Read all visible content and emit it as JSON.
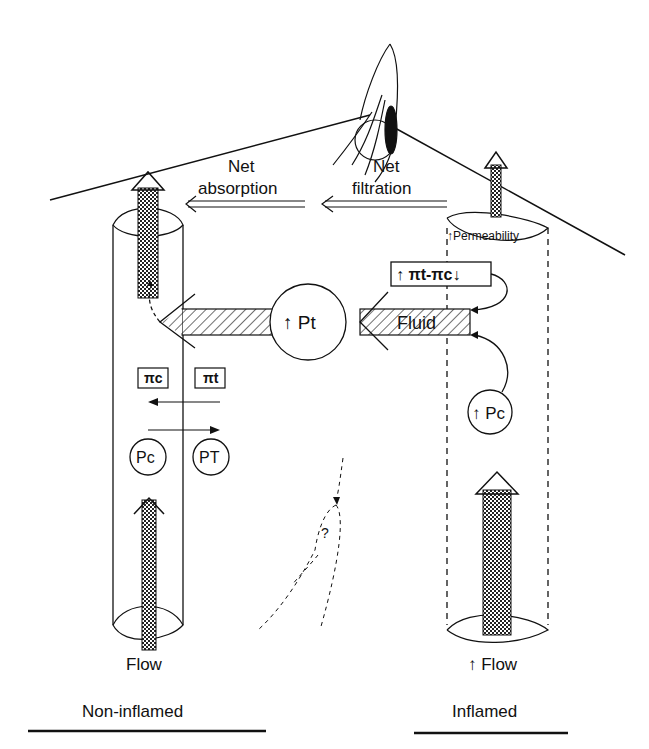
{
  "labels": {
    "net_absorption_1": "Net",
    "net_absorption_2": "absorption",
    "net_filtration_1": "Net",
    "net_filtration_2": "filtration",
    "permeability": "↑Permeability",
    "oncotic_gradient": "↑ πt-πc↓",
    "fluid": "Fluid",
    "tissue_pressure": "↑ Pt",
    "capillary_pressure_inflamed": "↑ Pc",
    "pi_c": "πc",
    "pi_t": "πt",
    "pc": "Pc",
    "pt": "PT",
    "question": "?",
    "flow_left": "Flow",
    "flow_right": "↑ Flow",
    "non_inflamed": "Non-inflamed",
    "inflamed": "Inflamed"
  },
  "colors": {
    "ink": "#111111",
    "background": "#ffffff"
  }
}
